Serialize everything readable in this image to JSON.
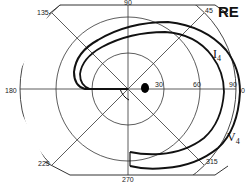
{
  "eye_label": "RE",
  "meridian_labels": {
    "m0": "0",
    "m45": "45",
    "m90": "90",
    "m135": "135",
    "m180": "180",
    "m225": "225",
    "m270": "270",
    "m315": "315"
  },
  "eccentricity_labels": {
    "e30": "30",
    "e60": "60",
    "e90": "90"
  },
  "isopters": [
    {
      "name": "I",
      "subscript": "4"
    },
    {
      "name": "V",
      "subscript": "4"
    }
  ],
  "colors": {
    "line": "#222222",
    "isopter": "#111111",
    "background": "#ffffff"
  }
}
